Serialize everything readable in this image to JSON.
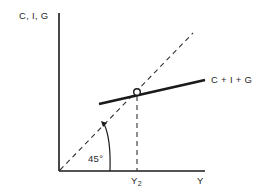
{
  "diagram": {
    "type": "keynesian-cross",
    "y_axis_label": "C, I, G",
    "x_axis_label": "Y",
    "equilibrium_label": "Y",
    "equilibrium_subscript": "2",
    "aggregate_demand_label": "C + I + G",
    "angle_label": "45°",
    "colors": {
      "ink": "#1a1a1a",
      "background": "#ffffff"
    }
  }
}
